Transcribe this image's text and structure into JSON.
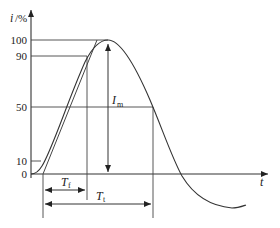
{
  "figure": {
    "type": "impulse-current-waveform",
    "axes": {
      "y_label_var": "i",
      "y_label_unit": "/%",
      "x_label": "t"
    },
    "y_ticks": [
      {
        "value": 100,
        "label": "100"
      },
      {
        "value": 90,
        "label": "90"
      },
      {
        "value": 50,
        "label": "50"
      },
      {
        "value": 10,
        "label": "10"
      },
      {
        "value": 0,
        "label": "0"
      }
    ],
    "annotations": {
      "peak_label_main": "I",
      "peak_label_sub": "m",
      "front_time_main": "T",
      "front_time_sub": "f",
      "tail_time_main": "T",
      "tail_time_sub": "t"
    },
    "colors": {
      "line": "#333333",
      "background": "#ffffff"
    }
  }
}
